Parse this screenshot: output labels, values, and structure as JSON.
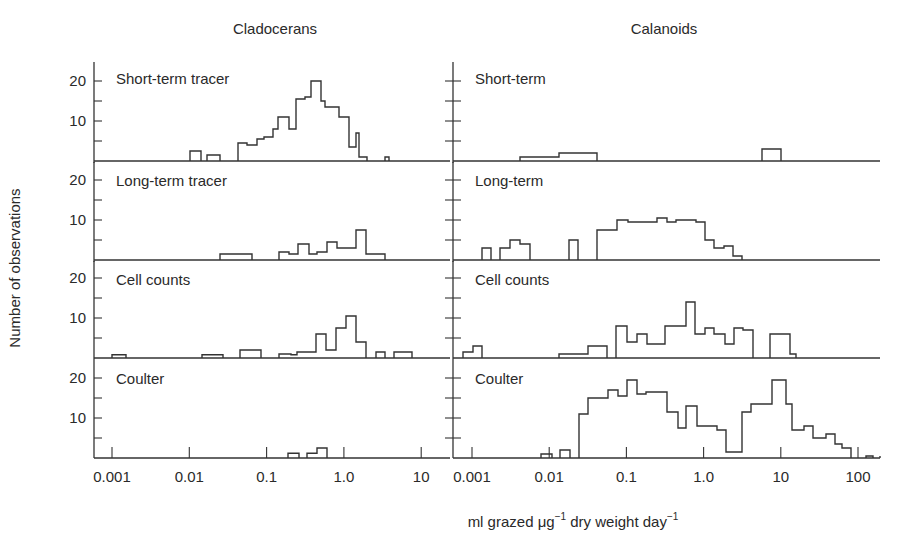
{
  "figure": {
    "column_titles": [
      "Cladocerans",
      "Calanoids"
    ],
    "ylabel": "Number of observations",
    "xlabel_parts": {
      "pre": "ml grazed ",
      "mu": "μg",
      "sup1": "−1",
      "mid": " dry weight day",
      "sup2": "−1"
    }
  },
  "chart_data": {
    "type": "bar",
    "title": "",
    "xlabel": "ml grazed μg⁻¹ dry weight day⁻¹",
    "ylabel": "Number of observations",
    "xscale": "log",
    "grid": false,
    "panels": [
      {
        "column": "Cladocerans",
        "row": 0,
        "label": "Short-term tracer",
        "xlim": [
          0.0007,
          20
        ],
        "ylim": [
          0,
          22
        ],
        "xticks": [
          "0.001",
          "0.01",
          "0.1",
          "1.0",
          "10"
        ],
        "yticks": [
          "10",
          "20"
        ],
        "bins_px": [
          190,
          201,
          207,
          220,
          227,
          238,
          247,
          257,
          264,
          273,
          278,
          289,
          296,
          305,
          311,
          321,
          325,
          331,
          339,
          349,
          356,
          359,
          367,
          376,
          385,
          389,
          398,
          409,
          419
        ],
        "counts": [
          2.5,
          0,
          1.5,
          0,
          0,
          4.5,
          4,
          5.5,
          6,
          8,
          11,
          8,
          15.5,
          16,
          20,
          15,
          13.5,
          13.5,
          11,
          3.5,
          7,
          1,
          0,
          0,
          1,
          0,
          0,
          0
        ]
      },
      {
        "column": "Cladocerans",
        "row": 1,
        "label": "Long-term tracer",
        "xlim": [
          0.0007,
          20
        ],
        "ylim": [
          0,
          22
        ],
        "xticks": [
          "0.001",
          "0.01",
          "0.1",
          "1.0",
          "10"
        ],
        "yticks": [
          "10",
          "20"
        ],
        "bins_px": [
          220,
          252,
          279,
          289,
          298,
          309,
          317,
          327,
          337,
          356,
          366,
          385
        ],
        "counts": [
          1.5,
          0,
          2,
          1.5,
          4,
          1.5,
          2,
          4.5,
          3,
          7.5,
          1.5
        ]
      },
      {
        "column": "Cladocerans",
        "row": 2,
        "label": "Cell counts",
        "xlim": [
          0.0007,
          20
        ],
        "ylim": [
          0,
          22
        ],
        "xticks": [
          "0.001",
          "0.01",
          "0.1",
          "1.0",
          "10"
        ],
        "yticks": [
          "10",
          "20"
        ],
        "bins_px": [
          112,
          126,
          202,
          223,
          240,
          261,
          279,
          291,
          297,
          316,
          326,
          336,
          346,
          356,
          366,
          376,
          385,
          394,
          412,
          421
        ],
        "counts": [
          0.8,
          0,
          0.8,
          0,
          2,
          0,
          1,
          0.8,
          1.5,
          6,
          2,
          7.5,
          10.5,
          4,
          0,
          1.5,
          0,
          1.5,
          0
        ]
      },
      {
        "column": "Cladocerans",
        "row": 3,
        "label": "Coulter",
        "xlim": [
          0.0007,
          20
        ],
        "ylim": [
          0,
          22
        ],
        "xticks": [
          "0.001",
          "0.01",
          "0.1",
          "1.0",
          "10"
        ],
        "yticks": [
          "10",
          "20"
        ],
        "bins_px": [
          288,
          299,
          307,
          317,
          327
        ],
        "counts": [
          1.2,
          0,
          1.2,
          2.5
        ]
      },
      {
        "column": "Calanoids",
        "row": 0,
        "label": "Short-term",
        "xlim": [
          0.0007,
          200
        ],
        "ylim": [
          0,
          22
        ],
        "xticks": [
          "0.001",
          "0.01",
          "0.1",
          "1.0",
          "10",
          "100"
        ],
        "yticks": [],
        "bins_px": [
          520,
          550,
          559,
          597,
          606,
          616,
          628,
          637,
          647,
          657,
          665,
          674,
          680,
          690,
          762,
          781
        ],
        "counts": [
          1,
          1,
          2,
          0,
          0,
          0,
          0,
          0,
          0,
          0,
          0,
          0,
          0,
          0,
          3
        ]
      },
      {
        "column": "Calanoids",
        "row": 1,
        "label": "Long-term",
        "xlim": [
          0.0007,
          200
        ],
        "ylim": [
          0,
          22
        ],
        "xticks": [
          "0.001",
          "0.01",
          "0.1",
          "1.0",
          "10",
          "100"
        ],
        "yticks": [],
        "bins_px": [
          482,
          491,
          500,
          510,
          520,
          530,
          559,
          569,
          578,
          597,
          617,
          628,
          647,
          657,
          667,
          676,
          696,
          705,
          714,
          724,
          733,
          742
        ],
        "counts": [
          3,
          0,
          3,
          5,
          4,
          0,
          0,
          5,
          0,
          7.5,
          10,
          9.5,
          9.5,
          10.5,
          9.5,
          10,
          9.5,
          5,
          3,
          3.5,
          1
        ]
      },
      {
        "column": "Calanoids",
        "row": 2,
        "label": "Cell counts",
        "xlim": [
          0.0007,
          200
        ],
        "ylim": [
          0,
          22
        ],
        "xticks": [
          "0.001",
          "0.01",
          "0.1",
          "1.0",
          "10",
          "100"
        ],
        "yticks": [],
        "bins_px": [
          463,
          473,
          482,
          550,
          559,
          588,
          607,
          616,
          627,
          637,
          647,
          665,
          686,
          695,
          705,
          714,
          725,
          734,
          743,
          753,
          770,
          790,
          796
        ],
        "counts": [
          1.5,
          3,
          0,
          0,
          1,
          3,
          0,
          8,
          4,
          6,
          3.5,
          8,
          14,
          6,
          7.5,
          6,
          3.5,
          7.5,
          7,
          0,
          6,
          1,
          0
        ]
      },
      {
        "column": "Calanoids",
        "row": 3,
        "label": "Coulter",
        "xlim": [
          0.0007,
          200
        ],
        "ylim": [
          0,
          22
        ],
        "xticks": [
          "0.001",
          "0.01",
          "0.1",
          "1.0",
          "10",
          "100"
        ],
        "yticks": [],
        "bins_px": [
          541,
          552,
          560,
          570,
          579,
          588,
          608,
          618,
          627,
          637,
          646,
          657,
          667,
          678,
          686,
          697,
          717,
          726,
          742,
          751,
          763,
          772,
          786,
          792,
          804,
          813,
          826,
          835,
          842,
          851,
          866,
          873,
          880
        ],
        "counts": [
          1,
          0,
          2,
          0,
          11,
          15,
          17,
          15.5,
          19.5,
          16,
          16.5,
          16.5,
          11.5,
          7.5,
          13,
          8,
          7,
          1.5,
          11.5,
          13.5,
          13.5,
          19.5,
          13.5,
          7,
          8,
          5,
          6,
          3.5,
          2.5,
          0,
          0.5,
          0,
          0.5
        ]
      }
    ]
  }
}
